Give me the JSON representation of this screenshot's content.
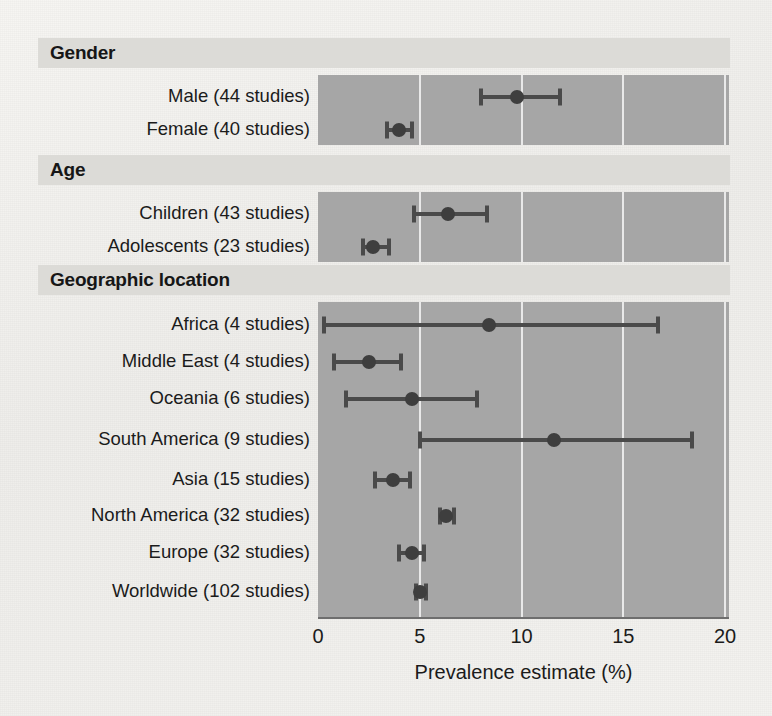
{
  "chart_data": {
    "type": "scatter",
    "title": "",
    "xlabel": "Prevalence estimate (%)",
    "ylabel": "",
    "xlim": [
      0,
      20
    ],
    "xticks": [
      "0",
      "5",
      "10",
      "15",
      "20"
    ],
    "xtick_values": [
      0,
      5,
      10,
      15,
      20
    ],
    "grid": "vertical white gridlines at 5, 10, 15, 20",
    "legend": "none",
    "sections": [
      {
        "header": "Gender",
        "rows": [
          {
            "label": "Male (44 studies)",
            "estimate": 9.8,
            "ci_low": 8.0,
            "ci_high": 11.9
          },
          {
            "label": "Female (40 studies)",
            "estimate": 4.0,
            "ci_low": 3.4,
            "ci_high": 4.6
          }
        ]
      },
      {
        "header": "Age",
        "rows": [
          {
            "label": "Children (43 studies)",
            "estimate": 6.4,
            "ci_low": 4.7,
            "ci_high": 8.3
          },
          {
            "label": "Adolescents (23 studies)",
            "estimate": 2.7,
            "ci_low": 2.2,
            "ci_high": 3.5
          }
        ]
      },
      {
        "header": "Geographic location",
        "rows": [
          {
            "label": "Africa (4 studies)",
            "estimate": 8.4,
            "ci_low": 0.3,
            "ci_high": 16.7
          },
          {
            "label": "Middle East (4 studies)",
            "estimate": 2.5,
            "ci_low": 0.8,
            "ci_high": 4.1
          },
          {
            "label": "Oceania (6 studies)",
            "estimate": 4.6,
            "ci_low": 1.4,
            "ci_high": 7.8
          },
          {
            "label": "South America (9 studies)",
            "estimate": 11.6,
            "ci_low": 5.0,
            "ci_high": 18.4
          },
          {
            "label": "Asia (15 studies)",
            "estimate": 3.7,
            "ci_low": 2.8,
            "ci_high": 4.5
          },
          {
            "label": "North America (32 studies)",
            "estimate": 6.3,
            "ci_low": 6.0,
            "ci_high": 6.7
          },
          {
            "label": "Europe (32 studies)",
            "estimate": 4.6,
            "ci_low": 4.0,
            "ci_high": 5.2
          },
          {
            "label": "Worldwide (102 studies)",
            "estimate": 5.0,
            "ci_low": 4.8,
            "ci_high": 5.3
          }
        ]
      }
    ],
    "colors": {
      "panel_background": "#a6a6a6",
      "header_band": "#dcdbd7",
      "marker": "#3e3e3e",
      "gridline": "#efefef",
      "page_background": "#f2f1ee"
    }
  }
}
